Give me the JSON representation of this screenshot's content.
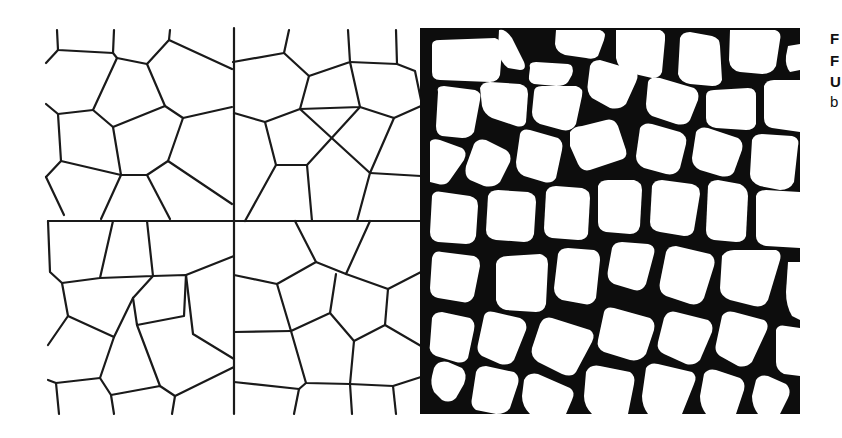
{
  "figure": {
    "panels": [
      {
        "id": "a",
        "description": "voronoi-tessellation-top-left"
      },
      {
        "id": "b",
        "description": "voronoi-tessellation-top-right"
      },
      {
        "id": "c",
        "description": "voronoi-tessellation-bottom-left"
      },
      {
        "id": "d",
        "description": "voronoi-tessellation-bottom-right"
      },
      {
        "id": "e",
        "description": "cellular-foam-micrograph"
      }
    ],
    "colors": {
      "line": "#1a1a1a",
      "background": "#ffffff",
      "micrograph_wall": "#0d0d0d"
    }
  },
  "side_text": {
    "lines": [
      {
        "text": "F",
        "bold": true
      },
      {
        "text": "F",
        "bold": true
      },
      {
        "text": "U",
        "bold": true
      },
      {
        "text": "b",
        "bold": false
      }
    ]
  }
}
